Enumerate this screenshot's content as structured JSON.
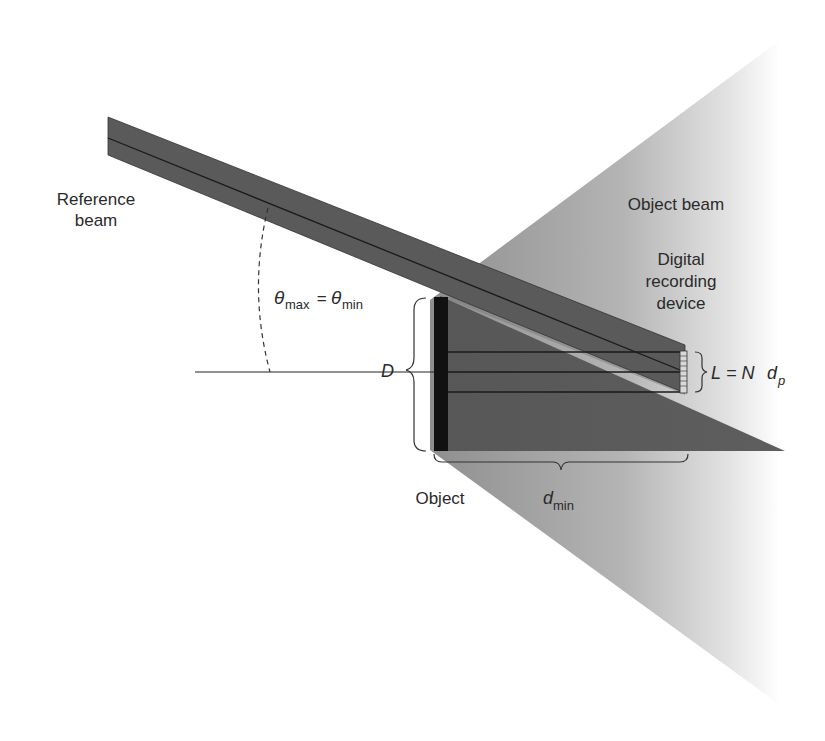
{
  "diagram": {
    "type": "optical-schematic",
    "labels": {
      "reference_beam_line1": "Reference",
      "reference_beam_line2": "beam",
      "object_beam": "Object beam",
      "device_line1": "Digital",
      "device_line2": "recording",
      "device_line3": "device",
      "object": "Object",
      "theta_max": "θ",
      "theta_max_sub": "max",
      "equals": " = ",
      "theta_min": "θ",
      "theta_min_sub": "min",
      "D": "D",
      "L_eq_L": "L",
      "L_eq_mid": " = N",
      "L_eq_d": "d",
      "L_eq_sub": "p",
      "d_min": "d",
      "d_min_sub": "min"
    },
    "colors": {
      "background": "#ffffff",
      "beam_dark": "#5a5a5a",
      "beam_edge": "#222222",
      "object_fill": "#111111",
      "cone_light": "#a8a8a8",
      "text": "#2a2a2a"
    }
  }
}
